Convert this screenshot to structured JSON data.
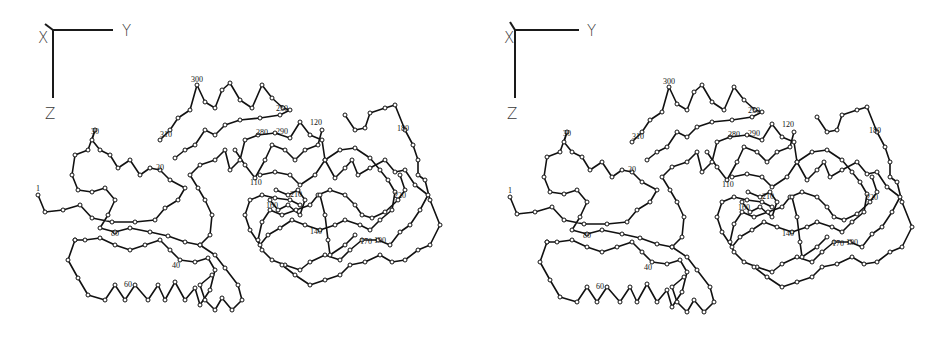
{
  "figure": {
    "background": "#ffffff",
    "ink_color": "#111111",
    "panel_offset": {
      "dx": 472,
      "dy": 2
    }
  },
  "panels": [
    {
      "id": "left",
      "axes": {
        "origin": [
          53,
          30
        ],
        "y_end": [
          113,
          30
        ],
        "z_end": [
          53,
          98
        ],
        "x_end": [
          45,
          24
        ],
        "labels": [
          {
            "text": "X",
            "x": 38,
            "y": 43
          },
          {
            "text": "Y",
            "x": 122,
            "y": 36
          },
          {
            "text": "Z",
            "x": 45,
            "y": 119
          }
        ]
      }
    },
    {
      "id": "right",
      "axes": {
        "origin": [
          515,
          30
        ],
        "y_end": [
          579,
          30
        ],
        "z_end": [
          515,
          98
        ],
        "x_end": [
          510,
          22
        ],
        "labels": [
          {
            "text": "X",
            "x": 504,
            "y": 43
          },
          {
            "text": "Y",
            "x": 587,
            "y": 36
          },
          {
            "text": "Z",
            "x": 507,
            "y": 119
          }
        ]
      }
    }
  ],
  "trace_chains": [
    [
      [
        38,
        195
      ],
      [
        45,
        212
      ],
      [
        63,
        210
      ],
      [
        80,
        205
      ],
      [
        92,
        218
      ],
      [
        112,
        222
      ],
      [
        135,
        222
      ],
      [
        155,
        220
      ],
      [
        165,
        208
      ],
      [
        178,
        200
      ],
      [
        185,
        188
      ],
      [
        170,
        180
      ],
      [
        160,
        170
      ],
      [
        150,
        168
      ],
      [
        140,
        175
      ],
      [
        130,
        160
      ],
      [
        118,
        168
      ],
      [
        110,
        155
      ],
      [
        100,
        150
      ],
      [
        92,
        140
      ],
      [
        95,
        130
      ],
      [
        88,
        150
      ],
      [
        75,
        155
      ],
      [
        72,
        175
      ],
      [
        78,
        190
      ],
      [
        92,
        192
      ],
      [
        105,
        188
      ],
      [
        115,
        200
      ],
      [
        108,
        215
      ],
      [
        100,
        228
      ],
      [
        115,
        232
      ],
      [
        130,
        228
      ],
      [
        150,
        232
      ],
      [
        168,
        236
      ],
      [
        185,
        242
      ],
      [
        200,
        245
      ],
      [
        210,
        235
      ],
      [
        212,
        215
      ],
      [
        205,
        200
      ],
      [
        198,
        188
      ],
      [
        190,
        175
      ],
      [
        200,
        165
      ],
      [
        215,
        160
      ],
      [
        225,
        150
      ],
      [
        230,
        170
      ],
      [
        240,
        160
      ],
      [
        245,
        140
      ],
      [
        258,
        135
      ],
      [
        275,
        133
      ],
      [
        290,
        138
      ],
      [
        300,
        122
      ],
      [
        310,
        135
      ],
      [
        322,
        140
      ],
      [
        325,
        160
      ],
      [
        335,
        178
      ],
      [
        345,
        168
      ],
      [
        352,
        160
      ],
      [
        358,
        175
      ],
      [
        370,
        168
      ],
      [
        385,
        160
      ],
      [
        395,
        172
      ],
      [
        405,
        170
      ],
      [
        415,
        185
      ],
      [
        428,
        195
      ],
      [
        420,
        210
      ],
      [
        410,
        225
      ],
      [
        400,
        232
      ],
      [
        390,
        245
      ],
      [
        378,
        240
      ],
      [
        362,
        240
      ],
      [
        350,
        250
      ],
      [
        340,
        260
      ],
      [
        325,
        255
      ],
      [
        310,
        262
      ],
      [
        300,
        270
      ],
      [
        285,
        265
      ],
      [
        272,
        260
      ],
      [
        262,
        250
      ],
      [
        258,
        240
      ],
      [
        262,
        222
      ],
      [
        270,
        210
      ],
      [
        282,
        215
      ],
      [
        296,
        210
      ],
      [
        310,
        205
      ],
      [
        318,
        195
      ],
      [
        330,
        190
      ],
      [
        345,
        195
      ],
      [
        355,
        205
      ],
      [
        362,
        215
      ],
      [
        372,
        218
      ],
      [
        385,
        212
      ],
      [
        398,
        200
      ],
      [
        405,
        190
      ],
      [
        400,
        175
      ]
    ],
    [
      [
        75,
        240
      ],
      [
        68,
        260
      ],
      [
        78,
        278
      ],
      [
        88,
        295
      ],
      [
        105,
        300
      ],
      [
        115,
        285
      ],
      [
        125,
        300
      ],
      [
        135,
        285
      ],
      [
        148,
        300
      ],
      [
        158,
        285
      ],
      [
        165,
        300
      ],
      [
        175,
        282
      ],
      [
        185,
        300
      ],
      [
        195,
        288
      ],
      [
        200,
        305
      ],
      [
        210,
        290
      ],
      [
        215,
        270
      ],
      [
        208,
        258
      ],
      [
        195,
        262
      ],
      [
        180,
        260
      ],
      [
        170,
        250
      ],
      [
        160,
        240
      ],
      [
        145,
        245
      ],
      [
        130,
        250
      ],
      [
        115,
        245
      ],
      [
        100,
        238
      ],
      [
        85,
        240
      ],
      [
        75,
        240
      ]
    ],
    [
      [
        200,
        245
      ],
      [
        215,
        255
      ],
      [
        225,
        268
      ],
      [
        238,
        285
      ],
      [
        242,
        300
      ],
      [
        232,
        310
      ],
      [
        222,
        298
      ],
      [
        215,
        310
      ],
      [
        205,
        300
      ],
      [
        200,
        285
      ],
      [
        212,
        275
      ]
    ],
    [
      [
        160,
        140
      ],
      [
        170,
        130
      ],
      [
        178,
        118
      ],
      [
        190,
        110
      ],
      [
        197,
        85
      ],
      [
        205,
        102
      ],
      [
        215,
        108
      ],
      [
        222,
        90
      ],
      [
        230,
        83
      ],
      [
        240,
        100
      ],
      [
        252,
        108
      ],
      [
        262,
        85
      ],
      [
        272,
        98
      ],
      [
        283,
        108
      ],
      [
        290,
        110
      ],
      [
        280,
        115
      ],
      [
        260,
        118
      ],
      [
        240,
        120
      ],
      [
        225,
        125
      ],
      [
        215,
        135
      ],
      [
        205,
        130
      ],
      [
        195,
        145
      ],
      [
        185,
        150
      ],
      [
        175,
        158
      ]
    ],
    [
      [
        345,
        115
      ],
      [
        355,
        130
      ],
      [
        365,
        128
      ],
      [
        370,
        113
      ],
      [
        385,
        108
      ],
      [
        395,
        105
      ],
      [
        405,
        130
      ],
      [
        413,
        145
      ],
      [
        418,
        160
      ],
      [
        418,
        175
      ],
      [
        425,
        180
      ],
      [
        430,
        200
      ],
      [
        440,
        225
      ],
      [
        430,
        245
      ],
      [
        418,
        250
      ],
      [
        405,
        260
      ],
      [
        392,
        262
      ],
      [
        380,
        255
      ],
      [
        365,
        262
      ],
      [
        350,
        265
      ],
      [
        340,
        275
      ],
      [
        325,
        280
      ],
      [
        310,
        285
      ],
      [
        295,
        275
      ],
      [
        282,
        265
      ]
    ],
    [
      [
        260,
        175
      ],
      [
        275,
        172
      ],
      [
        290,
        175
      ],
      [
        300,
        185
      ],
      [
        315,
        175
      ],
      [
        325,
        160
      ],
      [
        340,
        150
      ],
      [
        355,
        148
      ],
      [
        370,
        158
      ],
      [
        380,
        170
      ],
      [
        388,
        180
      ],
      [
        395,
        192
      ],
      [
        392,
        210
      ],
      [
        380,
        220
      ],
      [
        370,
        230
      ],
      [
        360,
        225
      ],
      [
        345,
        220
      ],
      [
        335,
        225
      ],
      [
        320,
        230
      ],
      [
        305,
        225
      ],
      [
        292,
        220
      ],
      [
        280,
        228
      ],
      [
        268,
        235
      ],
      [
        260,
        245
      ],
      [
        250,
        230
      ],
      [
        245,
        215
      ],
      [
        250,
        200
      ],
      [
        262,
        195
      ],
      [
        275,
        198
      ],
      [
        290,
        200
      ],
      [
        300,
        205
      ]
    ],
    [
      [
        235,
        150
      ],
      [
        245,
        165
      ],
      [
        255,
        178
      ],
      [
        265,
        160
      ],
      [
        272,
        145
      ],
      [
        285,
        150
      ],
      [
        295,
        160
      ],
      [
        305,
        150
      ],
      [
        318,
        145
      ],
      [
        322,
        130
      ]
    ],
    [
      [
        270,
        200
      ],
      [
        278,
        210
      ],
      [
        288,
        205
      ],
      [
        300,
        215
      ],
      [
        305,
        200
      ],
      [
        298,
        190
      ],
      [
        288,
        195
      ],
      [
        276,
        190
      ]
    ],
    [
      [
        320,
        195
      ],
      [
        325,
        215
      ],
      [
        328,
        240
      ],
      [
        330,
        255
      ],
      [
        345,
        245
      ],
      [
        355,
        235
      ]
    ]
  ],
  "residue_labels": [
    {
      "text": "1",
      "x": 36,
      "y": 191
    },
    {
      "text": "20",
      "x": 156,
      "y": 170
    },
    {
      "text": "30",
      "x": 91,
      "y": 134
    },
    {
      "text": "40",
      "x": 172,
      "y": 268
    },
    {
      "text": "60",
      "x": 124,
      "y": 287
    },
    {
      "text": "80",
      "x": 111,
      "y": 236
    },
    {
      "text": "110",
      "x": 250,
      "y": 185
    },
    {
      "text": "120",
      "x": 310,
      "y": 125
    },
    {
      "text": "140",
      "x": 310,
      "y": 234
    },
    {
      "text": "160",
      "x": 266,
      "y": 208
    },
    {
      "text": "170",
      "x": 360,
      "y": 244
    },
    {
      "text": "180",
      "x": 397,
      "y": 131
    },
    {
      "text": "190",
      "x": 374,
      "y": 243
    },
    {
      "text": "210",
      "x": 290,
      "y": 197
    },
    {
      "text": "220",
      "x": 394,
      "y": 198
    },
    {
      "text": "250",
      "x": 276,
      "y": 111
    },
    {
      "text": "280",
      "x": 256,
      "y": 135
    },
    {
      "text": "290",
      "x": 276,
      "y": 134
    },
    {
      "text": "300",
      "x": 191,
      "y": 82
    },
    {
      "text": "310",
      "x": 160,
      "y": 137
    }
  ]
}
